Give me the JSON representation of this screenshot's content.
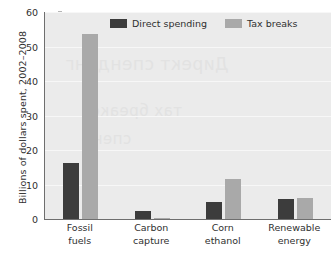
{
  "chart_data": {
    "type": "bar",
    "title": "",
    "xlabel": "",
    "ylabel": "Billions of dollars spent, 2002–2008",
    "ylim": [
      0,
      60
    ],
    "yticks": [
      0,
      10,
      20,
      30,
      40,
      50,
      60
    ],
    "grid": true,
    "legend_position": "top-center",
    "categories": [
      "Fossil fuels",
      "Carbon capture",
      "Corn ethanol",
      "Renewable energy"
    ],
    "category_lines": [
      [
        "Fossil",
        "fuels"
      ],
      [
        "Carbon",
        "capture"
      ],
      [
        "Corn",
        "ethanol"
      ],
      [
        "Renewable",
        "energy"
      ]
    ],
    "series": [
      {
        "name": "Direct spending",
        "color": "#3c3c3c",
        "values": [
          16.2,
          2.3,
          5.0,
          5.9
        ]
      },
      {
        "name": "Tax breaks",
        "color": "#a9a9a9",
        "values": [
          53.6,
          0.4,
          11.6,
          6.1
        ]
      }
    ]
  },
  "plot": {
    "background_color": "#ebebeb",
    "gridline_color": "#f7f7f7",
    "axis_color": "#6e6e6e"
  },
  "bleed_text": {
    "line1": "Директ спендинг",
    "line2": "тах бреакс",
    "line3": "спент"
  }
}
